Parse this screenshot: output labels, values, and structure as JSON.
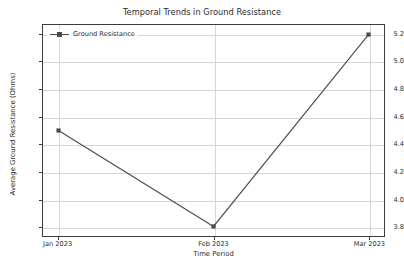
{
  "chart_data": {
    "type": "line",
    "title": "Temporal Trends in Ground Resistance",
    "xlabel": "Time Period",
    "ylabel": "Average Ground Resistance (Ohms)",
    "categories": [
      "Jan 2023",
      "Feb 2023",
      "Mar 2023"
    ],
    "series": [
      {
        "name": "Ground Resistance",
        "values": [
          4.5,
          3.8,
          5.2
        ],
        "color": "#4a4a4a",
        "marker": "square"
      }
    ],
    "yticks": [
      "3.8",
      "4.0",
      "4.2",
      "4.4",
      "4.6",
      "4.8",
      "5.0",
      "5.2"
    ],
    "ytick_values": [
      3.8,
      4.0,
      4.2,
      4.4,
      4.6,
      4.8,
      5.0,
      5.2
    ],
    "ylim": [
      3.73,
      5.27
    ],
    "xlim": [
      -0.1,
      2.1
    ],
    "grid": true,
    "legend_position": "upper left",
    "legend_frame": false
  },
  "legend": {
    "entries": [
      {
        "label": "Ground Resistance"
      }
    ]
  },
  "icons": {
    "legend_marker": "square-marker-icon",
    "legend_line": "line-sample-icon"
  }
}
